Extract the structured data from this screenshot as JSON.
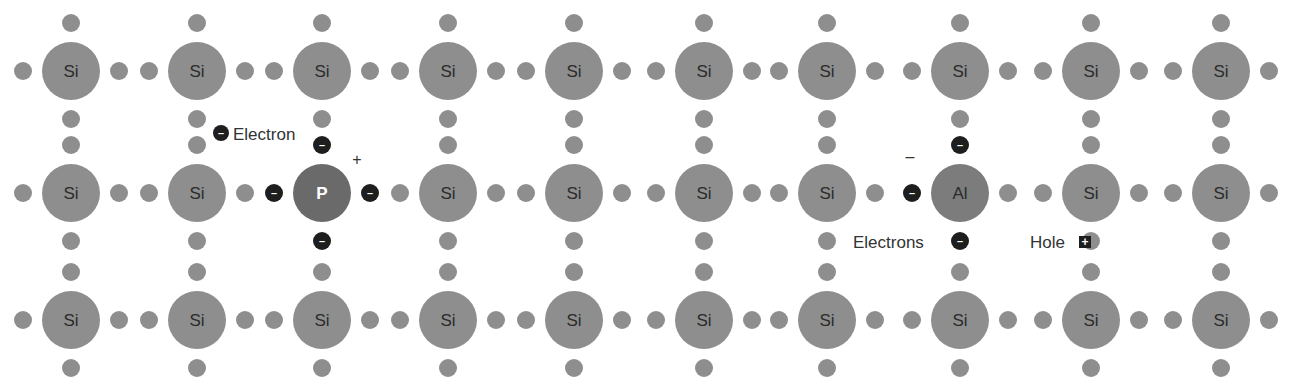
{
  "diagram": {
    "colors": {
      "background": "#ffffff",
      "si_atom": "#8e8e8e",
      "p_atom": "#6a6a6a",
      "al_atom": "#7c7c7c",
      "bond_electron": "#8e8e8e",
      "free_electron": "#1e1e1e",
      "hole": "#1e1e1e",
      "text": "#333333"
    },
    "grid": {
      "columns_x": [
        71,
        197,
        322,
        448,
        574,
        704,
        827,
        960,
        1091,
        1221
      ],
      "rows_y": [
        71,
        193,
        320
      ],
      "atom_radius": 29,
      "dot_radius": 9,
      "dot_offset": 48
    },
    "atoms": [
      {
        "row": 0,
        "col": 0,
        "symbol": "Si"
      },
      {
        "row": 0,
        "col": 1,
        "symbol": "Si"
      },
      {
        "row": 0,
        "col": 2,
        "symbol": "Si"
      },
      {
        "row": 0,
        "col": 3,
        "symbol": "Si"
      },
      {
        "row": 0,
        "col": 4,
        "symbol": "Si"
      },
      {
        "row": 0,
        "col": 5,
        "symbol": "Si"
      },
      {
        "row": 0,
        "col": 6,
        "symbol": "Si"
      },
      {
        "row": 0,
        "col": 7,
        "symbol": "Si"
      },
      {
        "row": 0,
        "col": 8,
        "symbol": "Si"
      },
      {
        "row": 0,
        "col": 9,
        "symbol": "Si"
      },
      {
        "row": 1,
        "col": 0,
        "symbol": "Si"
      },
      {
        "row": 1,
        "col": 1,
        "symbol": "Si"
      },
      {
        "row": 1,
        "col": 2,
        "symbol": "P"
      },
      {
        "row": 1,
        "col": 3,
        "symbol": "Si"
      },
      {
        "row": 1,
        "col": 4,
        "symbol": "Si"
      },
      {
        "row": 1,
        "col": 5,
        "symbol": "Si"
      },
      {
        "row": 1,
        "col": 6,
        "symbol": "Si"
      },
      {
        "row": 1,
        "col": 7,
        "symbol": "Al"
      },
      {
        "row": 1,
        "col": 8,
        "symbol": "Si"
      },
      {
        "row": 1,
        "col": 9,
        "symbol": "Si"
      },
      {
        "row": 2,
        "col": 0,
        "symbol": "Si"
      },
      {
        "row": 2,
        "col": 1,
        "symbol": "Si"
      },
      {
        "row": 2,
        "col": 2,
        "symbol": "Si"
      },
      {
        "row": 2,
        "col": 3,
        "symbol": "Si"
      },
      {
        "row": 2,
        "col": 4,
        "symbol": "Si"
      },
      {
        "row": 2,
        "col": 5,
        "symbol": "Si"
      },
      {
        "row": 2,
        "col": 6,
        "symbol": "Si"
      },
      {
        "row": 2,
        "col": 7,
        "symbol": "Si"
      },
      {
        "row": 2,
        "col": 8,
        "symbol": "Si"
      },
      {
        "row": 2,
        "col": 9,
        "symbol": "Si"
      }
    ],
    "special_dots": [
      {
        "row": 1,
        "col": 2,
        "side": "up",
        "type": "electron"
      },
      {
        "row": 1,
        "col": 2,
        "side": "down",
        "type": "electron"
      },
      {
        "row": 1,
        "col": 2,
        "side": "left",
        "type": "electron"
      },
      {
        "row": 1,
        "col": 2,
        "side": "right",
        "type": "electron"
      },
      {
        "row": 1,
        "col": 7,
        "side": "up",
        "type": "electron"
      },
      {
        "row": 1,
        "col": 7,
        "side": "down",
        "type": "electron"
      },
      {
        "row": 1,
        "col": 7,
        "side": "left",
        "type": "electron"
      }
    ],
    "labels": {
      "electron": {
        "text": "Electron",
        "x": 233,
        "y": 140,
        "marker_x": 221,
        "marker_y": 133
      },
      "electrons": {
        "text": "Electrons",
        "x": 853,
        "y": 248
      },
      "hole": {
        "text": "Hole",
        "x": 1030,
        "y": 248,
        "marker_x": 1085,
        "marker_y": 242
      },
      "p_charge": {
        "text": "+",
        "x": 357,
        "y": 165
      },
      "al_charge": {
        "text": "–",
        "x": 910,
        "y": 162
      }
    },
    "electron_glyph": "–",
    "hole_glyph": "+"
  }
}
